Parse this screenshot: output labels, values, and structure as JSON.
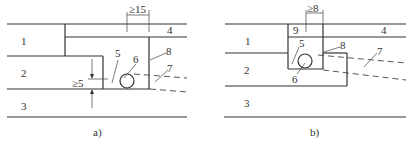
{
  "figure_a": {
    "caption": "a)",
    "labels": {
      "l1": "1",
      "l2": "2",
      "l3": "3",
      "l4": "4",
      "l5": "5",
      "l6": "6",
      "l7": "7",
      "l8": "8"
    },
    "dim_top": "≥15",
    "dim_side": "≥5"
  },
  "figure_b": {
    "caption": "b)",
    "labels": {
      "l1": "1",
      "l2": "2",
      "l3": "3",
      "l4": "4",
      "l5": "5",
      "l6": "6",
      "l7": "7",
      "l8": "8",
      "l9": "9"
    },
    "dim_top": "≥8"
  }
}
